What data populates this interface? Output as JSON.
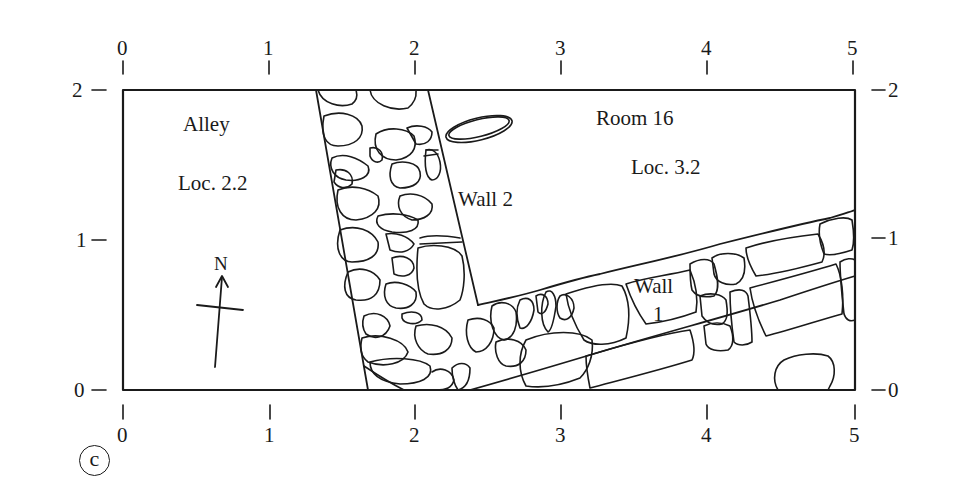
{
  "figure": {
    "panel_label": "c",
    "frame": {
      "x_min": 0,
      "x_max": 5,
      "y_min": 0,
      "y_max": 2,
      "units": "m"
    },
    "stroke_color": "#1a1a1a",
    "background": "#ffffff"
  },
  "axes": {
    "top_ticks": [
      "0",
      "1",
      "2",
      "3",
      "4",
      "5"
    ],
    "bottom_ticks": [
      "0",
      "1",
      "2",
      "3",
      "4",
      "5"
    ],
    "left_ticks": [
      "2",
      "1",
      "0"
    ],
    "right_ticks": [
      "2",
      "1",
      "0"
    ]
  },
  "labels": {
    "alley": "Alley",
    "alley_locus": "Loc. 2.2",
    "room": "Room 16",
    "room_locus": "Loc. 3.2",
    "wall2": "Wall 2",
    "wall1_line1": "Wall",
    "wall1_line2": "1",
    "north": "N"
  }
}
